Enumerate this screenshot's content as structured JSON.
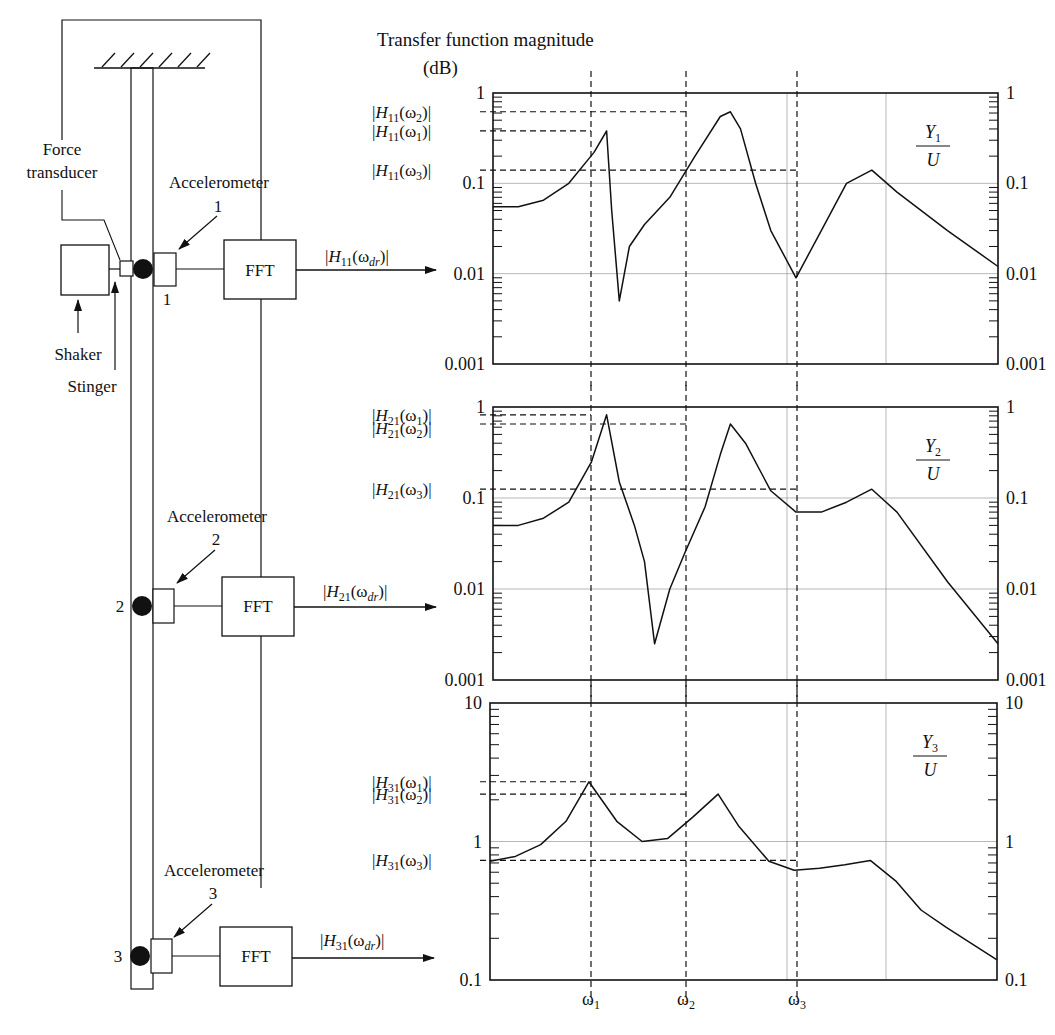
{
  "figure": {
    "title": "Transfer function magnitude",
    "unit": "(dB)"
  },
  "diagram": {
    "force_transducer_label": [
      "Force",
      "transducer"
    ],
    "shaker_label": "Shaker",
    "stinger_label": "Stinger",
    "accelerometer_label": "Accelerometer",
    "fft_label": "FFT",
    "stations": [
      {
        "id": "1",
        "accel_number": "1",
        "output_label": "|H11(ωdr)|",
        "output_H": "H",
        "output_sub": "11",
        "output_arg": "(ω",
        "output_argsub": "dr",
        "output_close": ")|"
      },
      {
        "id": "2",
        "accel_number": "2",
        "output_label": "|H21(ωdr)|",
        "output_H": "H",
        "output_sub": "21",
        "output_arg": "(ω",
        "output_argsub": "dr",
        "output_close": ")|"
      },
      {
        "id": "3",
        "accel_number": "3",
        "output_label": "|H31(ωdr)|",
        "output_H": "H",
        "output_sub": "31",
        "output_arg": "(ω",
        "output_argsub": "dr",
        "output_close": ")|"
      }
    ]
  },
  "chart_data": [
    {
      "type": "line",
      "title": "Y1/U",
      "ratio_num": "Y",
      "ratio_num_sub": "1",
      "ratio_den": "U",
      "yscale": "log",
      "ylim": [
        0.001,
        1
      ],
      "yticks": [
        "1",
        "0.1",
        "0.01",
        "0.001"
      ],
      "xlabel": "",
      "ylabel": "Transfer function magnitude (dB)",
      "x_markers": [
        "ω1",
        "ω2",
        "ω3"
      ],
      "peak_labels": [
        {
          "text": "|H11(ω2)|",
          "sub": "11",
          "w": "2",
          "value": 0.62
        },
        {
          "text": "|H11(ω1)|",
          "sub": "11",
          "w": "1",
          "value": 0.38
        },
        {
          "text": "|H11(ω3)|",
          "sub": "11",
          "w": "3",
          "value": 0.14
        }
      ],
      "x": [
        0.0,
        0.05,
        0.1,
        0.15,
        0.2,
        0.225,
        0.235,
        0.25,
        0.27,
        0.3,
        0.35,
        0.4,
        0.45,
        0.47,
        0.49,
        0.52,
        0.55,
        0.6,
        0.65,
        0.7,
        0.75,
        0.8,
        0.9,
        1.0
      ],
      "values": [
        0.055,
        0.055,
        0.065,
        0.1,
        0.22,
        0.38,
        0.05,
        0.005,
        0.02,
        0.035,
        0.07,
        0.2,
        0.55,
        0.62,
        0.4,
        0.1,
        0.03,
        0.009,
        0.03,
        0.1,
        0.14,
        0.08,
        0.03,
        0.012
      ]
    },
    {
      "type": "line",
      "title": "Y2/U",
      "ratio_num": "Y",
      "ratio_num_sub": "2",
      "ratio_den": "U",
      "yscale": "log",
      "ylim": [
        0.001,
        1
      ],
      "yticks": [
        "1",
        "0.1",
        "0.01",
        "0.001"
      ],
      "x_markers": [
        "ω1",
        "ω2",
        "ω3"
      ],
      "peak_labels": [
        {
          "text": "|H21(ω1)|",
          "sub": "21",
          "w": "1",
          "value": 0.82
        },
        {
          "text": "|H21(ω2)|",
          "sub": "21",
          "w": "2",
          "value": 0.65
        },
        {
          "text": "|H21(ω3)|",
          "sub": "21",
          "w": "3",
          "value": 0.125
        }
      ],
      "x": [
        0.0,
        0.05,
        0.1,
        0.15,
        0.195,
        0.225,
        0.25,
        0.28,
        0.3,
        0.32,
        0.35,
        0.38,
        0.42,
        0.45,
        0.47,
        0.5,
        0.55,
        0.6,
        0.65,
        0.7,
        0.75,
        0.8,
        0.9,
        1.0
      ],
      "values": [
        0.05,
        0.05,
        0.06,
        0.09,
        0.25,
        0.82,
        0.15,
        0.05,
        0.02,
        0.0025,
        0.01,
        0.025,
        0.08,
        0.3,
        0.65,
        0.4,
        0.12,
        0.07,
        0.07,
        0.09,
        0.125,
        0.07,
        0.012,
        0.0025
      ]
    },
    {
      "type": "line",
      "title": "Y3/U",
      "ratio_num": "Y",
      "ratio_num_sub": "3",
      "ratio_den": "U",
      "yscale": "log",
      "ylim": [
        0.1,
        10
      ],
      "yticks": [
        "10",
        "1",
        "0.1"
      ],
      "x_markers": [
        "ω1",
        "ω2",
        "ω3"
      ],
      "peak_labels": [
        {
          "text": "|H31(ω1)|",
          "sub": "31",
          "w": "1",
          "value": 2.7
        },
        {
          "text": "|H31(ω2)|",
          "sub": "31",
          "w": "2",
          "value": 2.2
        },
        {
          "text": "|H31(ω3)|",
          "sub": "31",
          "w": "3",
          "value": 0.73
        }
      ],
      "x": [
        0.0,
        0.05,
        0.1,
        0.15,
        0.195,
        0.25,
        0.3,
        0.35,
        0.4,
        0.45,
        0.49,
        0.55,
        0.6,
        0.65,
        0.7,
        0.75,
        0.8,
        0.85,
        0.9,
        1.0
      ],
      "values": [
        0.72,
        0.78,
        0.95,
        1.4,
        2.7,
        1.4,
        1.0,
        1.05,
        1.5,
        2.2,
        1.3,
        0.72,
        0.62,
        0.64,
        0.68,
        0.73,
        0.52,
        0.32,
        0.24,
        0.14
      ]
    }
  ]
}
